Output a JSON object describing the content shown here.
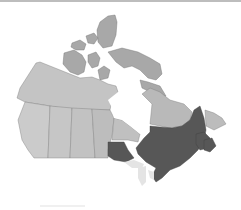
{
  "map": {
    "subject": "Canada",
    "style": "grayscale relief map",
    "highlighted_regions": [
      "Ontario (north-west portion)",
      "Quebec",
      "Southern Ontario",
      "New Brunswick",
      "Nova Scotia",
      "Newfoundland"
    ],
    "colors": {
      "background": "#ffffff",
      "land": "#bfbfbf",
      "land_light": "#cdcdcd",
      "arctic": "#a9a9a9",
      "highlight": "#555555",
      "highlight_dark": "#474747",
      "water_lakes": "#e6e6e6",
      "borders": "#7a7a7a"
    }
  }
}
